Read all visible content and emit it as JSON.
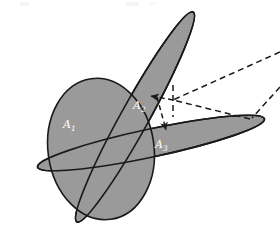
{
  "figure": {
    "background_color": "#ffffff",
    "fill_color": "#9a9a9a",
    "stroke_color": "#1a1a1a",
    "label_color": "#ffffff",
    "dash_color": "#1a1a1a",
    "width": 280,
    "height": 227
  },
  "labels": {
    "a1": "A",
    "a1_sub": "1",
    "a2": "A",
    "a2_sub": "2",
    "a3": "A",
    "a3_sub": "3"
  },
  "regions": [
    {
      "name": "region-a1",
      "label": "A1",
      "shape": "ellipse",
      "cx": 101,
      "cy": 149,
      "rx": 53,
      "ry": 71,
      "rotation": -8,
      "fill": "#9a9a9a"
    },
    {
      "name": "region-a2",
      "label": "A2",
      "shape": "ellipse",
      "cx": 135,
      "cy": 117,
      "rx": 120,
      "ry": 14,
      "rotation": -61,
      "fill": "#9a9a9a"
    },
    {
      "name": "region-a3",
      "label": "A3",
      "shape": "ellipse",
      "cx": 151,
      "cy": 143,
      "rx": 116,
      "ry": 14,
      "rotation": -12,
      "fill": "#9a9a9a"
    }
  ],
  "leaders": [
    {
      "name": "leader-upper-right",
      "from": [
        279,
        53
      ],
      "to": [
        172,
        100
      ],
      "style": "dashed"
    },
    {
      "name": "leader-lower-right",
      "from": [
        279,
        88
      ],
      "to": [
        172,
        100
      ],
      "style": "dashed"
    },
    {
      "name": "leader-vertical-stub",
      "from": [
        172,
        86
      ],
      "to": [
        172,
        118
      ],
      "style": "dashed"
    },
    {
      "name": "leader-arrow-to-a2",
      "from": [
        172,
        100
      ],
      "to": [
        150,
        96
      ],
      "style": "dashed",
      "arrow": true
    },
    {
      "name": "leader-arrow-to-a3",
      "from": [
        158,
        97
      ],
      "to": [
        166,
        131
      ],
      "style": "dashed",
      "arrow": true
    },
    {
      "name": "leader-lower-to-a3",
      "from": [
        255,
        119
      ],
      "to": [
        172,
        100
      ],
      "style": "dashed"
    }
  ],
  "label_positions": {
    "a1": {
      "x": 63,
      "y": 128
    },
    "a2": {
      "x": 134,
      "y": 108
    },
    "a3": {
      "x": 156,
      "y": 148
    }
  },
  "ghost_fragments": [
    {
      "name": "ghost-fragment-left",
      "x": 22,
      "y": 5,
      "text": ""
    },
    {
      "name": "ghost-fragment-right",
      "x": 128,
      "y": 5,
      "text": ""
    }
  ]
}
